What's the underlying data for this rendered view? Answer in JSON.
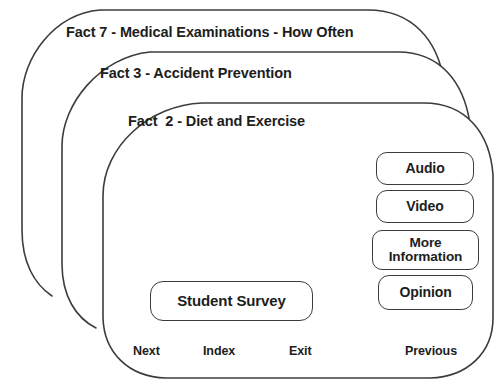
{
  "app": {
    "title": "Fact Card Stack",
    "stroke_color": "#3c3c3c",
    "text_color": "#1d1d1d",
    "background_color": "#ffffff"
  },
  "cards": [
    {
      "id": "card-back-2",
      "title": "Fact 7 - Medical Examinations - How Often",
      "position": "back"
    },
    {
      "id": "card-back-1",
      "title": "Fact 3 - Accident Prevention",
      "position": "middle"
    },
    {
      "id": "card-front",
      "title": "Fact  2 - Diet and Exercise",
      "position": "front"
    }
  ],
  "front_card": {
    "title": "Fact  2 - Diet and Exercise",
    "media_buttons": [
      {
        "name": "audio",
        "label": "Audio"
      },
      {
        "name": "video",
        "label": "Video"
      },
      {
        "name": "more-information",
        "label_line_1": "More",
        "label_line_2": "Information"
      },
      {
        "name": "opinion",
        "label": "Opinion"
      }
    ],
    "primary_button": {
      "name": "student-survey",
      "label": "Student Survey"
    },
    "navigation": [
      {
        "name": "next",
        "label": "Next"
      },
      {
        "name": "index",
        "label": "Index"
      },
      {
        "name": "exit",
        "label": "Exit"
      },
      {
        "name": "previous",
        "label": "Previous"
      }
    ]
  }
}
